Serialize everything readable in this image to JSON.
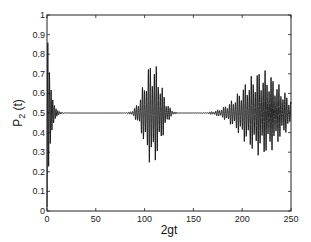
{
  "chart_data": {
    "type": "line",
    "title": "",
    "xlabel": "2gt",
    "ylabel": "P_2 (t)",
    "ylabel_main": "P",
    "ylabel_sub": "2",
    "ylabel_tail": " (t)",
    "xlim": [
      0,
      250
    ],
    "ylim": [
      0,
      1
    ],
    "x_ticks": [
      0,
      50,
      100,
      150,
      200,
      250
    ],
    "x_tick_labels": [
      "0",
      "50",
      "100",
      "150",
      "200",
      "250"
    ],
    "y_ticks": [
      0,
      0.1,
      0.2,
      0.3,
      0.4,
      0.5,
      0.6,
      0.7,
      0.8,
      0.9,
      1
    ],
    "y_tick_labels": [
      "0",
      "0.1",
      "0.2",
      "0.3",
      "0.4",
      "0.5",
      "0.6",
      "0.7",
      "0.8",
      "0.9",
      "1"
    ],
    "grid": false,
    "legend": null,
    "series": [
      {
        "name": "P_2(t)",
        "color": "#111111",
        "description": "Collapse-and-revival oscillations about 0.5",
        "baseline": 0.5,
        "packets": [
          {
            "center": 2,
            "width": 3,
            "amplitude": 0.48,
            "freq": 1.3,
            "note": "initial oscillation 0→~0.95, decays by t≈10"
          },
          {
            "center": 108,
            "width": 12,
            "amplitude": 0.27,
            "freq": 1.55,
            "note": "first revival, max ≈0.77, min ≈0.24"
          },
          {
            "center": 220,
            "width": 28,
            "amplitude": 0.22,
            "freq": 1.55,
            "note": "second revival, max ≈0.72, min ≈0.28"
          }
        ],
        "key_points": [
          {
            "x": 0,
            "y": 0.0
          },
          {
            "x": 1,
            "y": 0.95
          },
          {
            "x": 3,
            "y": 0.2
          },
          {
            "x": 5,
            "y": 0.65
          },
          {
            "x": 10,
            "y": 0.5
          },
          {
            "x": 75,
            "y": 0.5
          },
          {
            "x": 107,
            "y": 0.77
          },
          {
            "x": 108,
            "y": 0.24
          },
          {
            "x": 140,
            "y": 0.5
          },
          {
            "x": 150,
            "y": 0.5
          },
          {
            "x": 227,
            "y": 0.72
          },
          {
            "x": 250,
            "y": 0.5
          }
        ]
      }
    ]
  }
}
